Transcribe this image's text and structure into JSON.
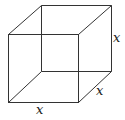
{
  "diagram": {
    "type": "cube",
    "stroke_color": "#333333",
    "label_color": "#222222",
    "front_face": {
      "x1": 8.5,
      "y1": 34.5,
      "x2": 78.5,
      "y2": 102.5
    },
    "back_face": {
      "x1": 41.5,
      "y1": 5.5,
      "x2": 111.5,
      "y2": 71.5
    },
    "labels": [
      {
        "id": "height",
        "text": "x",
        "x": 113,
        "y": 42
      },
      {
        "id": "depth",
        "text": "x",
        "x": 96,
        "y": 95
      },
      {
        "id": "width",
        "text": "x",
        "x": 36,
        "y": 114
      }
    ]
  }
}
